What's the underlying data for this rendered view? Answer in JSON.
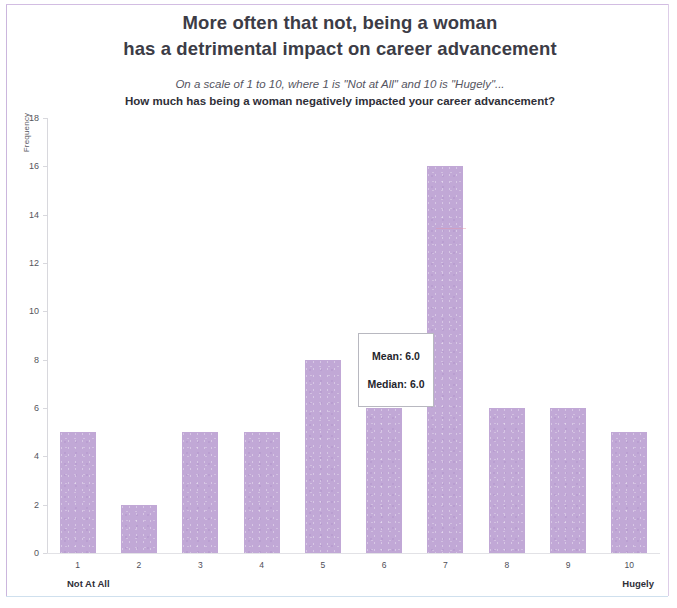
{
  "title": {
    "line1": "More often that not, being a woman",
    "line2": "has a detrimental impact on career advancement"
  },
  "subtitle": {
    "line1": "On a scale of 1 to 10, where 1 is \"Not at All\" and 10 is \"Hugely\"...",
    "line2": "How much has being a woman negatively impacted your career advancement?"
  },
  "annotation": {
    "mean": "Mean: 6.0",
    "median": "Median: 6.0"
  },
  "axis": {
    "y_title": "Frequency",
    "x_end_left": "Not At All",
    "x_end_right": "Hugely"
  },
  "colors": {
    "bar_fill": "#c1a8d6",
    "page_border": "#cbb6dd",
    "title_text": "#3c3c46",
    "axis_text": "#55555c"
  },
  "chart_data": {
    "type": "bar",
    "title": "More often that not, being a woman has a detrimental impact on career advancement",
    "subtitle": "On a scale of 1 to 10, where 1 is \"Not at All\" and 10 is \"Hugely\"... How much has being a woman negatively impacted your career advancement?",
    "xlabel": "",
    "ylabel": "Frequency",
    "categories": [
      "1",
      "2",
      "3",
      "4",
      "5",
      "6",
      "7",
      "8",
      "9",
      "10"
    ],
    "values": [
      5,
      2,
      5,
      5,
      8,
      6,
      16,
      6,
      6,
      5
    ],
    "ylim": [
      0,
      18
    ],
    "yticks": [
      0,
      2,
      4,
      6,
      8,
      10,
      12,
      14,
      16,
      18
    ],
    "ytick_labels": [
      "0",
      "2",
      "4",
      "6",
      "8",
      "10",
      "12",
      "14",
      "16",
      "18"
    ],
    "grid": false,
    "legend": false,
    "annotations": [
      "Mean: 6.0",
      "Median: 6.0"
    ],
    "x_axis_endpoints": {
      "low": "Not At All",
      "high": "Hugely"
    },
    "bar_color": "#c1a8d6"
  }
}
